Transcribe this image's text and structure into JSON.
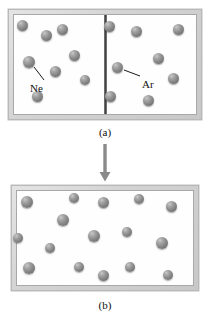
{
  "figure": {
    "background_color": "#ffffff",
    "atom_color": "#8d8d8d",
    "frame_color": "#d3d3d3",
    "partition_color": "#3d3d3d"
  },
  "panel_a": {
    "caption": "(a)",
    "partition": "present",
    "left_gas": {
      "label": "Ne",
      "count": 8,
      "label_position": {
        "x": 30,
        "y": 83
      },
      "leader": {
        "x1": 44,
        "y1": 80,
        "x2": 34,
        "y2": 67
      },
      "atoms": [
        {
          "x": 22,
          "y": 25,
          "d": 11
        },
        {
          "x": 62,
          "y": 29,
          "d": 11
        },
        {
          "x": 46,
          "y": 35,
          "d": 11
        },
        {
          "x": 29,
          "y": 62,
          "d": 12
        },
        {
          "x": 74,
          "y": 55,
          "d": 11
        },
        {
          "x": 55,
          "y": 71,
          "d": 11
        },
        {
          "x": 85,
          "y": 80,
          "d": 10
        },
        {
          "x": 37,
          "y": 96,
          "d": 11
        }
      ]
    },
    "right_gas": {
      "label": "Ar",
      "count": 8,
      "label_position": {
        "x": 142,
        "y": 79
      },
      "leader": {
        "x1": 140,
        "y1": 76,
        "x2": 124,
        "y2": 70
      },
      "atoms": [
        {
          "x": 109,
          "y": 26,
          "d": 11
        },
        {
          "x": 136,
          "y": 31,
          "d": 11
        },
        {
          "x": 178,
          "y": 29,
          "d": 11
        },
        {
          "x": 158,
          "y": 58,
          "d": 11
        },
        {
          "x": 117,
          "y": 67,
          "d": 11
        },
        {
          "x": 173,
          "y": 78,
          "d": 11
        },
        {
          "x": 110,
          "y": 96,
          "d": 11
        },
        {
          "x": 148,
          "y": 100,
          "d": 11
        }
      ]
    }
  },
  "arrow": {
    "direction": "down",
    "name": "transition-arrow"
  },
  "panel_b": {
    "caption": "(b)",
    "mixed": true,
    "count": 16,
    "atoms": [
      {
        "x": 27,
        "y": 202,
        "d": 12
      },
      {
        "x": 74,
        "y": 198,
        "d": 10
      },
      {
        "x": 103,
        "y": 202,
        "d": 11
      },
      {
        "x": 139,
        "y": 199,
        "d": 10
      },
      {
        "x": 171,
        "y": 206,
        "d": 11
      },
      {
        "x": 63,
        "y": 220,
        "d": 12
      },
      {
        "x": 18,
        "y": 238,
        "d": 10
      },
      {
        "x": 94,
        "y": 236,
        "d": 12
      },
      {
        "x": 127,
        "y": 232,
        "d": 10
      },
      {
        "x": 162,
        "y": 243,
        "d": 12
      },
      {
        "x": 50,
        "y": 248,
        "d": 10
      },
      {
        "x": 29,
        "y": 268,
        "d": 12
      },
      {
        "x": 79,
        "y": 267,
        "d": 10
      },
      {
        "x": 103,
        "y": 275,
        "d": 11
      },
      {
        "x": 130,
        "y": 267,
        "d": 10
      },
      {
        "x": 168,
        "y": 275,
        "d": 10
      }
    ]
  }
}
